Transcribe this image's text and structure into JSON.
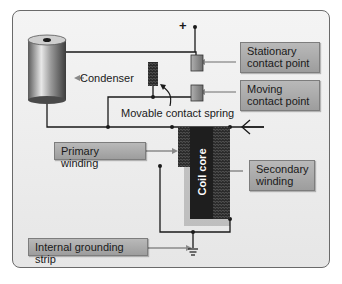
{
  "diagram": {
    "type": "ignition coil breaker-point circuit",
    "labels": {
      "condenser": "Condenser",
      "stationary_contact": "Stationary\ncontact point",
      "stationary_line1": "Stationary",
      "stationary_line2": "contact point",
      "moving_line1": "Moving",
      "moving_line2": "contact point",
      "movable_spring": "Movable contact spring",
      "primary_winding": "Primary winding",
      "secondary_line1": "Secondary",
      "secondary_line2": "winding",
      "coil_core": "Coil core",
      "grounding_strip": "Internal grounding strip",
      "positive_terminal": "+"
    },
    "colors": {
      "panel_border": "#6a6a6a",
      "label_fill": "#a8a8a8",
      "core": "#1e1e1e",
      "wire": "#1a1a1a",
      "contact": "#8a8a8a"
    }
  }
}
